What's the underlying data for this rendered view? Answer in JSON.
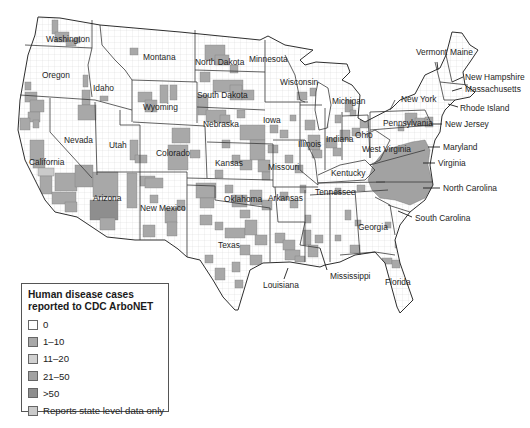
{
  "legend": {
    "title_line1": "Human disease cases",
    "title_line2": "reported to CDC ArboNET",
    "items": [
      {
        "label": "0",
        "color": "#ffffff"
      },
      {
        "label": "1–10",
        "color": "#a8a8a8"
      },
      {
        "label": "11–20",
        "color": "#d0d0d0"
      },
      {
        "label": "21–50",
        "color": "#a2a2a2"
      },
      {
        "label": ">50",
        "color": "#8e8e8e"
      },
      {
        "label": "Reports state level data only",
        "color": "#cacaca"
      }
    ]
  },
  "colors": {
    "land": "#ffffff",
    "county_lines": "#d8d8d8",
    "1-10": "#a8a8a8",
    "11-20": "#d0d0d0",
    "21-50": "#a2a2a2",
    ">50": "#8e8e8e",
    "state": "#cacaca"
  },
  "map": {
    "outline": "38,17 60,18 100,25 180,32 260,40 268,36 285,45 313,50 300,60 305,65 316,62 347,64 350,72 342,80 352,85 360,95 358,118 365,122 392,108 400,100 415,94 425,75 440,68 446,55 452,32 462,33 470,45 478,50 470,62 463,72 465,85 475,92 470,97 455,100 445,110 442,116 440,132 435,140 433,148 430,165 433,185 425,200 410,212 400,225 395,240 400,263 413,300 400,313 397,307 385,263 375,252 355,255 340,262 325,265 320,267 290,262 263,263 250,270 238,310 235,310 223,297 213,280 200,260 187,257 178,249 165,240 135,240 107,237 77,217 55,212 45,200 35,180 25,160 18,130 20,100 23,83 28,55 35,35",
    "lake_michigan": "318,82 328,88 331,105 327,128 319,130 315,110 316,92",
    "borders": [
      "25,45 92,48",
      "92,20 92,48",
      "92,48 88,65 92,97",
      "20,95 95,100 132,110",
      "100,25 102,45 115,60 125,70 132,80",
      "132,80 132,122",
      "50,98 50,132 92,178",
      "95,102 97,175",
      "97,172 140,172",
      "120,110 120,125 140,125 140,240",
      "132,80 197,82",
      "195,30 195,82",
      "197,82 197,123",
      "133,122 205,126",
      "195,70 265,72",
      "197,107 265,110",
      "205,126 207,178",
      "207,142 273,144",
      "187,172 187,257",
      "140,172 187,172",
      "187,178 273,180",
      "187,185 215,186 215,200 270,208",
      "265,40 265,102",
      "265,102 308,102",
      "285,55 295,75 300,100 305,102",
      "273,140 305,140",
      "273,144 273,187",
      "305,140 315,160 318,185",
      "273,187 318,187",
      "275,187 278,222",
      "278,222 305,222",
      "270,208 270,262",
      "305,222 300,245 320,248",
      "305,190 305,262",
      "330,190 330,262",
      "355,190 360,255",
      "300,105 322,105",
      "300,102 300,170 318,185",
      "325,108 325,170",
      "342,112 342,160",
      "342,116 368,115",
      "368,115 370,158",
      "318,175 340,165 365,160 375,170 365,180 318,183",
      "310,195 388,190",
      "318,183 385,182",
      "365,135 375,130 390,140 380,160 370,165",
      "370,165 425,150",
      "376,182 432,182",
      "388,205 410,212",
      "375,197 390,205 395,235",
      "340,255 375,252 395,255",
      "370,112 425,110",
      "370,130 432,125",
      "370,112 370,158",
      "425,110 432,125",
      "390,110 395,100",
      "435,62 440,82 444,100",
      "446,55 452,82",
      "440,82 468,85",
      "444,100 455,100"
    ],
    "shaded_blocks": [
      [
        52,
        20,
        6,
        14,
        "1-10"
      ],
      [
        55,
        32,
        14,
        10,
        "1-10"
      ],
      [
        66,
        40,
        10,
        6,
        "1-10"
      ],
      [
        74,
        38,
        6,
        5,
        "1-10"
      ],
      [
        25,
        82,
        6,
        8,
        "1-10"
      ],
      [
        25,
        92,
        12,
        10,
        "1-10"
      ],
      [
        30,
        100,
        14,
        12,
        "1-10"
      ],
      [
        28,
        112,
        12,
        10,
        "1-10"
      ],
      [
        20,
        118,
        10,
        12,
        "1-10"
      ],
      [
        33,
        120,
        6,
        8,
        "1-10"
      ],
      [
        83,
        75,
        5,
        12,
        "1-10"
      ],
      [
        82,
        90,
        8,
        15,
        "1-10"
      ],
      [
        78,
        105,
        18,
        15,
        "1-10"
      ],
      [
        100,
        96,
        8,
        5,
        "1-10"
      ],
      [
        130,
        48,
        8,
        7,
        "1-10"
      ],
      [
        138,
        92,
        14,
        10,
        "1-10"
      ],
      [
        145,
        100,
        12,
        12,
        "1-10"
      ],
      [
        160,
        85,
        8,
        18,
        "1-10"
      ],
      [
        170,
        85,
        7,
        15,
        "1-10"
      ],
      [
        30,
        140,
        14,
        20,
        "1-10"
      ],
      [
        33,
        160,
        12,
        8,
        "1-10"
      ],
      [
        38,
        168,
        16,
        8,
        "state"
      ],
      [
        40,
        176,
        12,
        18,
        "1-10"
      ],
      [
        55,
        173,
        22,
        18,
        "1-10"
      ],
      [
        52,
        192,
        24,
        12,
        "1-10"
      ],
      [
        65,
        202,
        12,
        10,
        "1-10"
      ],
      [
        75,
        165,
        18,
        22,
        "21-50"
      ],
      [
        93,
        172,
        25,
        25,
        "1-10"
      ],
      [
        90,
        200,
        28,
        20,
        ">50"
      ],
      [
        100,
        218,
        15,
        12,
        "1-10"
      ],
      [
        127,
        173,
        10,
        35,
        "1-10"
      ],
      [
        130,
        140,
        8,
        20,
        "1-10"
      ],
      [
        135,
        155,
        12,
        8,
        "1-10"
      ],
      [
        140,
        176,
        15,
        10,
        "1-10"
      ],
      [
        145,
        178,
        18,
        10,
        "1-10"
      ],
      [
        150,
        195,
        8,
        8,
        "1-10"
      ],
      [
        165,
        208,
        12,
        15,
        "1-10"
      ],
      [
        167,
        222,
        10,
        14,
        "1-10"
      ],
      [
        143,
        225,
        12,
        12,
        "1-10"
      ],
      [
        177,
        200,
        8,
        10,
        "1-10"
      ],
      [
        172,
        128,
        18,
        15,
        "1-10"
      ],
      [
        168,
        145,
        20,
        25,
        "1-10"
      ],
      [
        190,
        150,
        10,
        8,
        "1-10"
      ],
      [
        205,
        45,
        20,
        15,
        "1-10"
      ],
      [
        215,
        55,
        14,
        10,
        "1-10"
      ],
      [
        230,
        65,
        8,
        8,
        "1-10"
      ],
      [
        200,
        72,
        10,
        10,
        "1-10"
      ],
      [
        213,
        80,
        30,
        12,
        "1-10"
      ],
      [
        230,
        85,
        12,
        15,
        "1-10"
      ],
      [
        242,
        90,
        12,
        10,
        "1-10"
      ],
      [
        198,
        95,
        10,
        20,
        "1-10"
      ],
      [
        206,
        110,
        20,
        12,
        "1-10"
      ],
      [
        220,
        115,
        10,
        8,
        "1-10"
      ],
      [
        237,
        110,
        8,
        8,
        "1-10"
      ],
      [
        240,
        125,
        25,
        15,
        "1-10"
      ],
      [
        250,
        140,
        15,
        20,
        "1-10"
      ],
      [
        222,
        140,
        8,
        8,
        "1-10"
      ],
      [
        232,
        155,
        8,
        8,
        "1-10"
      ],
      [
        240,
        160,
        12,
        10,
        "1-10"
      ],
      [
        258,
        160,
        12,
        12,
        "1-10"
      ],
      [
        262,
        172,
        8,
        8,
        "1-10"
      ],
      [
        215,
        170,
        8,
        8,
        "1-10"
      ],
      [
        196,
        183,
        20,
        15,
        "1-10"
      ],
      [
        200,
        198,
        14,
        10,
        "1-10"
      ],
      [
        225,
        185,
        8,
        8,
        "1-10"
      ],
      [
        232,
        195,
        15,
        12,
        "1-10"
      ],
      [
        250,
        190,
        12,
        15,
        "1-10"
      ],
      [
        262,
        200,
        10,
        10,
        "1-10"
      ],
      [
        240,
        210,
        10,
        8,
        "1-10"
      ],
      [
        200,
        215,
        12,
        10,
        "1-10"
      ],
      [
        215,
        222,
        8,
        8,
        "1-10"
      ],
      [
        225,
        228,
        20,
        10,
        "1-10"
      ],
      [
        245,
        220,
        12,
        15,
        "1-10"
      ],
      [
        255,
        235,
        12,
        10,
        "1-10"
      ],
      [
        240,
        245,
        10,
        10,
        "1-10"
      ],
      [
        250,
        255,
        12,
        10,
        "1-10"
      ],
      [
        232,
        262,
        8,
        10,
        "1-10"
      ],
      [
        215,
        268,
        10,
        12,
        "1-10"
      ],
      [
        235,
        280,
        8,
        8,
        "1-10"
      ],
      [
        205,
        255,
        8,
        8,
        "1-10"
      ],
      [
        275,
        233,
        10,
        10,
        "1-10"
      ],
      [
        283,
        240,
        12,
        10,
        "1-10"
      ],
      [
        285,
        250,
        15,
        10,
        "1-10"
      ],
      [
        295,
        256,
        10,
        6,
        "1-10"
      ],
      [
        303,
        230,
        8,
        15,
        "1-10"
      ],
      [
        308,
        245,
        10,
        12,
        "1-10"
      ],
      [
        315,
        235,
        8,
        8,
        "1-10"
      ],
      [
        305,
        215,
        6,
        8,
        "1-10"
      ],
      [
        280,
        192,
        8,
        8,
        "1-10"
      ],
      [
        290,
        200,
        8,
        8,
        "1-10"
      ],
      [
        300,
        185,
        6,
        8,
        "1-10"
      ],
      [
        268,
        145,
        10,
        8,
        "1-10"
      ],
      [
        285,
        155,
        8,
        8,
        "1-10"
      ],
      [
        295,
        165,
        8,
        8,
        "1-10"
      ],
      [
        270,
        125,
        8,
        8,
        "1-10"
      ],
      [
        280,
        130,
        8,
        8,
        "1-10"
      ],
      [
        290,
        115,
        6,
        6,
        "1-10"
      ],
      [
        305,
        120,
        10,
        10,
        "1-10"
      ],
      [
        308,
        135,
        12,
        15,
        "1-10"
      ],
      [
        312,
        150,
        10,
        8,
        "1-10"
      ],
      [
        320,
        120,
        8,
        8,
        "1-10"
      ],
      [
        326,
        138,
        11,
        10,
        "1-10"
      ],
      [
        333,
        148,
        8,
        8,
        "1-10"
      ],
      [
        340,
        130,
        10,
        10,
        "1-10"
      ],
      [
        297,
        92,
        10,
        8,
        "1-10"
      ],
      [
        310,
        88,
        6,
        8,
        "1-10"
      ],
      [
        345,
        100,
        8,
        12,
        "1-10"
      ],
      [
        335,
        115,
        6,
        8,
        "1-10"
      ],
      [
        350,
        110,
        6,
        6,
        "1-10"
      ],
      [
        352,
        128,
        8,
        8,
        "1-10"
      ],
      [
        360,
        120,
        8,
        8,
        "1-10"
      ],
      [
        405,
        113,
        12,
        12,
        "1-10"
      ],
      [
        415,
        118,
        10,
        8,
        "1-10"
      ],
      [
        425,
        117,
        8,
        10,
        "1-10"
      ],
      [
        398,
        125,
        6,
        6,
        "1-10"
      ],
      [
        335,
        188,
        6,
        6,
        "1-10"
      ],
      [
        357,
        185,
        8,
        6,
        "1-10"
      ],
      [
        345,
        210,
        6,
        10,
        "1-10"
      ],
      [
        355,
        220,
        6,
        6,
        "1-10"
      ],
      [
        335,
        235,
        6,
        6,
        "1-10"
      ],
      [
        350,
        245,
        10,
        8,
        "1-10"
      ],
      [
        385,
        222,
        6,
        6,
        "1-10"
      ],
      [
        382,
        258,
        10,
        6,
        "1-10"
      ],
      [
        392,
        260,
        8,
        8,
        "1-10"
      ],
      [
        378,
        272,
        8,
        8,
        "1-10"
      ],
      [
        395,
        240,
        8,
        8,
        "1-10"
      ]
    ],
    "shaded_regions": [
      {
        "points": "373,165 385,150 398,146 412,142 425,140 430,150 428,165 433,185 425,198 410,205 395,200 380,198 372,190 368,180",
        "level": "21-50"
      }
    ],
    "labels": [
      {
        "text": "Washington",
        "x": 46,
        "y": 42
      },
      {
        "text": "Oregon",
        "x": 42,
        "y": 78
      },
      {
        "text": "Idaho",
        "x": 93,
        "y": 91
      },
      {
        "text": "Montana",
        "x": 143,
        "y": 60
      },
      {
        "text": "Wyoming",
        "x": 143,
        "y": 110
      },
      {
        "text": "North Dakota",
        "x": 195,
        "y": 65
      },
      {
        "text": "South Dakota",
        "x": 197,
        "y": 98
      },
      {
        "text": "Minnesota",
        "x": 249,
        "y": 62
      },
      {
        "text": "Wisconsin",
        "x": 280,
        "y": 85
      },
      {
        "text": "Michigan",
        "x": 332,
        "y": 104
      },
      {
        "text": "Nebraska",
        "x": 203,
        "y": 127
      },
      {
        "text": "Iowa",
        "x": 263,
        "y": 123
      },
      {
        "text": "Illinois",
        "x": 298,
        "y": 147
      },
      {
        "text": "Indiana",
        "x": 326,
        "y": 142
      },
      {
        "text": "Ohio",
        "x": 355,
        "y": 138
      },
      {
        "text": "Nevada",
        "x": 64,
        "y": 143
      },
      {
        "text": "Utah",
        "x": 109,
        "y": 148
      },
      {
        "text": "Colorado",
        "x": 156,
        "y": 156
      },
      {
        "text": "California",
        "x": 29,
        "y": 165
      },
      {
        "text": "Kansas",
        "x": 215,
        "y": 166
      },
      {
        "text": "Missouri",
        "x": 268,
        "y": 170
      },
      {
        "text": "Kentucky",
        "x": 331,
        "y": 176
      },
      {
        "text": "West Virginia",
        "x": 362,
        "y": 152
      },
      {
        "text": "Pennsylvania",
        "x": 383,
        "y": 126
      },
      {
        "text": "New York",
        "x": 401,
        "y": 102
      },
      {
        "text": "Arizona",
        "x": 93,
        "y": 201
      },
      {
        "text": "New Mexico",
        "x": 140,
        "y": 211
      },
      {
        "text": "Oklahoma",
        "x": 224,
        "y": 202
      },
      {
        "text": "Arkansas",
        "x": 268,
        "y": 201
      },
      {
        "text": "Tennessee",
        "x": 315,
        "y": 195
      },
      {
        "text": "Texas",
        "x": 218,
        "y": 248
      },
      {
        "text": "Louisiana",
        "x": 263,
        "y": 288
      },
      {
        "text": "Mississippi",
        "x": 330,
        "y": 279
      },
      {
        "text": "Georgia",
        "x": 358,
        "y": 230
      },
      {
        "text": "Florida",
        "x": 385,
        "y": 285
      },
      {
        "text": "Vermont",
        "x": 416,
        "y": 55
      },
      {
        "text": "Maine",
        "x": 450,
        "y": 55
      },
      {
        "text": "New Hampshire",
        "x": 465,
        "y": 80
      },
      {
        "text": "Massachusetts",
        "x": 465,
        "y": 92
      },
      {
        "text": "Rhode Island",
        "x": 460,
        "y": 111
      },
      {
        "text": "New Jersey",
        "x": 445,
        "y": 127
      },
      {
        "text": "Maryland",
        "x": 443,
        "y": 150
      },
      {
        "text": "Virginia",
        "x": 438,
        "y": 166
      },
      {
        "text": "North Carolina",
        "x": 443,
        "y": 191
      },
      {
        "text": "South Carolina",
        "x": 415,
        "y": 221
      }
    ],
    "leaders": [
      [
        437,
        62,
        438,
        70
      ],
      [
        463,
        77,
        452,
        82
      ],
      [
        462,
        88,
        452,
        91
      ],
      [
        458,
        107,
        448,
        104
      ],
      [
        442,
        124,
        432,
        124
      ],
      [
        440,
        147,
        428,
        147
      ],
      [
        435,
        163,
        423,
        163
      ],
      [
        440,
        188,
        423,
        188
      ],
      [
        412,
        217,
        398,
        211
      ],
      [
        284,
        279,
        288,
        268
      ],
      [
        327,
        270,
        320,
        248
      ]
    ]
  }
}
